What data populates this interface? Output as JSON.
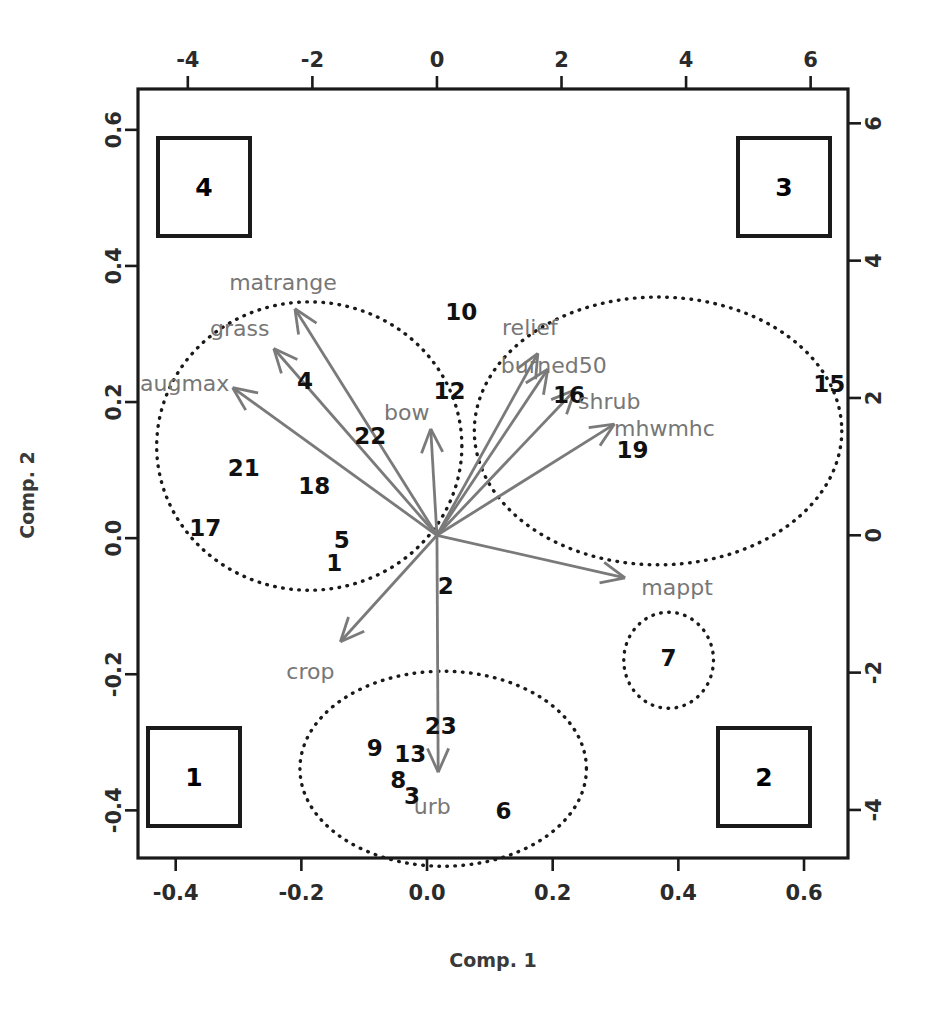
{
  "chart_data": {
    "type": "scatter",
    "subtype": "pca-biplot",
    "title": "",
    "xlabel": "Comp. 1",
    "ylabel": "Comp. 2",
    "grid": false,
    "legend_position": "corners",
    "axes": {
      "bottom": {
        "name": "Comp. 1 (scores scale)",
        "ticks": [
          "-0.4",
          "-0.2",
          "0.0",
          "0.2",
          "0.4",
          "0.6"
        ],
        "values": [
          -0.4,
          -0.2,
          0.0,
          0.2,
          0.4,
          0.6
        ],
        "range": [
          -0.46,
          0.67
        ]
      },
      "left": {
        "name": "Comp. 2 (scores scale)",
        "ticks": [
          "0.6",
          "0.4",
          "0.2",
          "0.0",
          "-0.2",
          "-0.4"
        ],
        "values": [
          0.6,
          0.4,
          0.2,
          0.0,
          -0.2,
          -0.4
        ],
        "range": [
          -0.47,
          0.66
        ]
      },
      "top": {
        "name": "Comp. 1 (loadings scale)",
        "ticks": [
          "-4",
          "-2",
          "0",
          "2",
          "4",
          "6"
        ],
        "values": [
          -4,
          -2,
          0,
          2,
          4,
          6
        ],
        "range": [
          -4.8,
          6.6
        ]
      },
      "right": {
        "name": "Comp. 2 (loadings scale)",
        "ticks": [
          "6",
          "4",
          "2",
          "0",
          "-2",
          "-4"
        ],
        "values": [
          6,
          4,
          2,
          0,
          -2,
          -4
        ],
        "range": [
          -4.7,
          6.5
        ]
      }
    },
    "observations": [
      {
        "label": "10",
        "x": 0.392,
        "y": 3.25
      },
      {
        "label": "12",
        "x": 0.2,
        "y": 2.1
      },
      {
        "label": "4",
        "x": -2.12,
        "y": 2.25
      },
      {
        "label": "22",
        "x": -1.07,
        "y": 1.45
      },
      {
        "label": "21",
        "x": -3.1,
        "y": 0.98
      },
      {
        "label": "18",
        "x": -1.97,
        "y": 0.72
      },
      {
        "label": "17",
        "x": -3.72,
        "y": 0.1
      },
      {
        "label": "5",
        "x": -1.53,
        "y": -0.07
      },
      {
        "label": "1",
        "x": -1.65,
        "y": -0.4
      },
      {
        "label": "2",
        "x": 0.14,
        "y": -0.74
      },
      {
        "label": "16",
        "x": 2.12,
        "y": 2.05
      },
      {
        "label": "15",
        "x": 6.3,
        "y": 2.2
      },
      {
        "label": "19",
        "x": 3.14,
        "y": 1.24
      },
      {
        "label": "7",
        "x": 3.72,
        "y": -1.78
      },
      {
        "label": "23",
        "x": 0.06,
        "y": -2.78
      },
      {
        "label": "9",
        "x": -1.0,
        "y": -3.1
      },
      {
        "label": "13",
        "x": -0.43,
        "y": -3.18
      },
      {
        "label": "8",
        "x": -0.62,
        "y": -3.57
      },
      {
        "label": "3",
        "x": -0.4,
        "y": -3.8
      },
      {
        "label": "6",
        "x": 1.07,
        "y": -4.02
      }
    ],
    "variable_vectors": [
      {
        "label": "matrange",
        "x": -2.28,
        "y": 3.3
      },
      {
        "label": "grass",
        "x": -2.62,
        "y": 2.72
      },
      {
        "label": "augmax",
        "x": -3.28,
        "y": 2.15
      },
      {
        "label": "bow",
        "x": -0.1,
        "y": 1.55
      },
      {
        "label": "relief",
        "x": 1.62,
        "y": 2.65
      },
      {
        "label": "burned50",
        "x": 1.78,
        "y": 2.42
      },
      {
        "label": "shrub",
        "x": 2.22,
        "y": 2.12
      },
      {
        "label": "mhwmhc",
        "x": 2.85,
        "y": 1.62
      },
      {
        "label": "mappt",
        "x": 3.02,
        "y": -0.62
      },
      {
        "label": "crop",
        "x": -1.55,
        "y": -1.55
      },
      {
        "label": "urb",
        "x": 0.02,
        "y": -3.45
      }
    ],
    "cluster_ellipses": [
      {
        "name": "cluster-left",
        "cx": -2.05,
        "cy": 1.3,
        "rx": 2.45,
        "ry": 2.1,
        "style": "dotted"
      },
      {
        "name": "cluster-right",
        "cx": 3.55,
        "cy": 1.52,
        "rx": 2.95,
        "ry": 1.95,
        "style": "dotted"
      },
      {
        "name": "cluster-bottom",
        "cx": 0.1,
        "cy": -3.4,
        "rx": 2.3,
        "ry": 1.42,
        "style": "dotted"
      },
      {
        "name": "cluster-small",
        "cx": 3.72,
        "cy": -1.82,
        "rx": 0.72,
        "ry": 0.7,
        "style": "dotted"
      }
    ],
    "quadrant_boxes": [
      {
        "label": "4",
        "corner": "top-left"
      },
      {
        "label": "3",
        "corner": "top-right"
      },
      {
        "label": "1",
        "corner": "bottom-left"
      },
      {
        "label": "2",
        "corner": "bottom-right"
      }
    ],
    "colors": {
      "frame": "#1a1a1a",
      "arrow": "#7a7a7a",
      "variable_label": "#777777",
      "observation_label": "#111111",
      "ellipse": "#1a1a1a",
      "background": "#ffffff"
    }
  }
}
